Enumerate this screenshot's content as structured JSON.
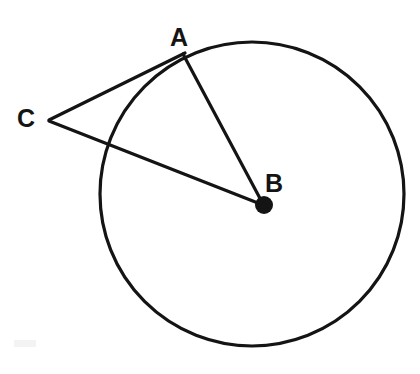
{
  "canvas": {
    "width": 420,
    "height": 374,
    "background_color": "#ffffff",
    "stroke_color": "#141414"
  },
  "diagram": {
    "type": "circle-tangent-secant",
    "title": "",
    "circle": {
      "name": "main-circle",
      "center_x": 252,
      "center_y": 194,
      "radius": 152,
      "stroke_width": 3.2,
      "fill": "none"
    },
    "points": [
      {
        "id": "A",
        "label": "A",
        "x": 184,
        "y": 54,
        "label_x": 170,
        "label_y": 25,
        "marker": "none",
        "on_circle": true,
        "role": "tangent-point"
      },
      {
        "id": "B",
        "label": "B",
        "x": 264,
        "y": 205,
        "label_x": 265,
        "label_y": 171,
        "marker": "filled-dot",
        "marker_radius": 9,
        "on_circle": false,
        "role": "center"
      },
      {
        "id": "C",
        "label": "C",
        "x": 49,
        "y": 120,
        "label_x": 17,
        "label_y": 106,
        "marker": "none",
        "on_circle": false,
        "role": "external-point"
      }
    ],
    "segments": [
      {
        "id": "CA",
        "from": "C",
        "to": "A",
        "x1": 49,
        "y1": 120,
        "x2": 185,
        "y2": 53,
        "stroke_width": 3.2,
        "role": "tangent-line"
      },
      {
        "id": "AB",
        "from": "A",
        "to": "B",
        "x1": 183,
        "y1": 54,
        "x2": 263,
        "y2": 204,
        "stroke_width": 3.2,
        "role": "radius"
      },
      {
        "id": "CB",
        "from": "C",
        "to": "B",
        "x1": 49,
        "y1": 121,
        "x2": 263,
        "y2": 205,
        "stroke_width": 3.2,
        "role": "secant-to-center"
      }
    ],
    "label_font_size": 25,
    "label_font_weight": "bold"
  },
  "artifact": {
    "name": "scan-speck",
    "x": 14,
    "y": 340,
    "width": 22,
    "height": 7,
    "color": "#f1f1f1"
  }
}
